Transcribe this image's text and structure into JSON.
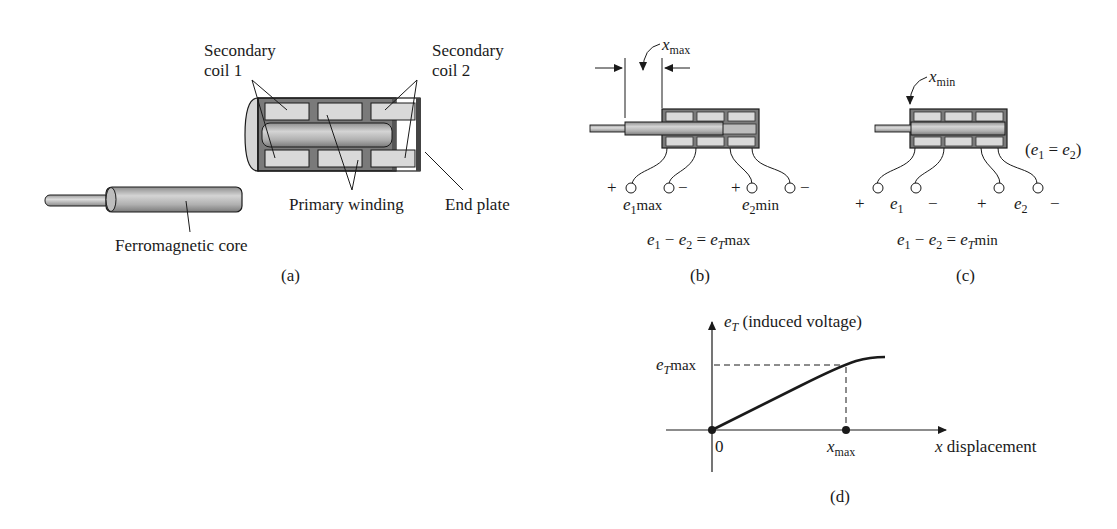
{
  "figure": {
    "panels": {
      "a": {
        "caption": "(a)",
        "labels": {
          "secondary_coil_1_line1": "Secondary",
          "secondary_coil_1_line2": "coil 1",
          "secondary_coil_2_line1": "Secondary",
          "secondary_coil_2_line2": "coil 2",
          "primary_winding": "Primary winding",
          "end_plate": "End plate",
          "core": "Ferromagnetic core"
        }
      },
      "b": {
        "caption": "(b)",
        "displacement_label_base": "x",
        "displacement_label_sub": "max",
        "terminals": {
          "plus1": "+",
          "minus1": "−",
          "plus2": "+",
          "minus2": "−"
        },
        "e1_base": "e",
        "e1_sub": "1",
        "e1_suffix": "max",
        "e2_base": "e",
        "e2_sub": "2",
        "e2_suffix": "min",
        "equation": {
          "e1": "e",
          "e1_sub": "1",
          "minus": " − ",
          "e2": "e",
          "e2_sub": "2",
          "equals": " = ",
          "eT": "e",
          "eT_sub": "T",
          "suffix": "max"
        }
      },
      "c": {
        "caption": "(c)",
        "displacement_label_base": "x",
        "displacement_label_sub": "min",
        "note": "(e₁ = e₂)",
        "note_parts": {
          "open": "(",
          "e1": "e",
          "e1_sub": "1",
          "eq": " = ",
          "e2": "e",
          "e2_sub": "2",
          "close": ")"
        },
        "terminals": {
          "plus1": "+",
          "minus1": "−",
          "plus2": "+",
          "minus2": "−"
        },
        "e1_base": "e",
        "e1_sub": "1",
        "e2_base": "e",
        "e2_sub": "2",
        "equation": {
          "e1": "e",
          "e1_sub": "1",
          "minus": " − ",
          "e2": "e",
          "e2_sub": "2",
          "equals": " = ",
          "eT": "e",
          "eT_sub": "T",
          "suffix": "min"
        }
      },
      "d": {
        "caption": "(d)",
        "y_axis_label_base": "e",
        "y_axis_label_sub": "T",
        "y_axis_label_text": " (induced voltage)",
        "y_tick_base": "e",
        "y_tick_sub": "T",
        "y_tick_suffix": "max",
        "origin_label": "0",
        "x_tick_base": "x",
        "x_tick_sub": "max",
        "x_axis_label_base": "x",
        "x_axis_label_text": " displacement"
      }
    },
    "colors": {
      "ink": "#1a1a1a",
      "housing": "#7a7a7a",
      "coil_fill": "#d9d9d9",
      "core_fill": "#b8b8b8",
      "core_light": "#d0d0d0"
    }
  }
}
